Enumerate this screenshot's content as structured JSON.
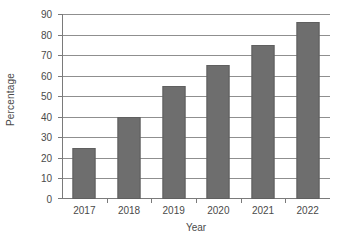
{
  "chart_data": {
    "type": "bar",
    "title": "",
    "categories": [
      "2017",
      "2018",
      "2019",
      "2020",
      "2021",
      "2022"
    ],
    "values": [
      25,
      40,
      55,
      65,
      75,
      86
    ],
    "xlabel": "Year",
    "ylabel": "Percentage",
    "ylim": [
      0,
      90
    ],
    "ytick_step": 10,
    "yticks": [
      0,
      10,
      20,
      30,
      40,
      50,
      60,
      70,
      80,
      90
    ],
    "ytick_labels": [
      "0",
      "10",
      "20",
      "30",
      "40",
      "50",
      "60",
      "70",
      "80",
      "90"
    ],
    "grid": true,
    "grid_axis": "y",
    "legend": false,
    "legend_position": "none",
    "series": [
      {
        "name": "Percentage",
        "values": [
          25,
          40,
          55,
          65,
          75,
          86
        ],
        "color": "#6e6e6e"
      }
    ]
  },
  "style": {
    "background": "#ffffff",
    "bar_fill": "#6e6e6e",
    "bar_edge": "#5f5f5f",
    "grid_color": "#8f8f8f",
    "axis_color": "#7a7a7a",
    "text_color": "#4a4a4a"
  }
}
